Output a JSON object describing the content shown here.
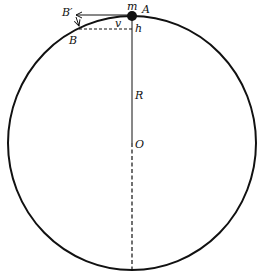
{
  "diagram": {
    "labels": {
      "mass": "m",
      "point_a": "A",
      "point_b": "B",
      "point_b_prime": "B′",
      "velocity": "v",
      "height": "h",
      "radius": "R",
      "center": "O"
    },
    "colors": {
      "stroke": "#111111",
      "background": "#ffffff"
    }
  }
}
